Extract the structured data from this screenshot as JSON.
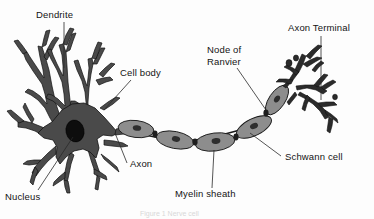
{
  "figure": {
    "background_color": "#fdfdfd",
    "caption": "Figure 1  Nerve cell"
  },
  "palette": {
    "cell_fill": "#4a4a4a",
    "cell_stroke": "#111111",
    "nucleus_fill": "#0d0d0d",
    "myelin_fill": "#8d8d8d",
    "myelin_stroke": "#1a1a1a",
    "schwann_nucleus": "#2e2e2e",
    "label_text": "#141414",
    "leader_line": "#2a2a2a"
  },
  "labels": [
    {
      "id": "dendrite",
      "text": "Dendrite",
      "lines": [
        "Dendrite"
      ]
    },
    {
      "id": "cell-body",
      "text": "Cell body",
      "lines": [
        "Cell body"
      ]
    },
    {
      "id": "node-of-ranvier",
      "text": "Node of Ranvier",
      "lines": [
        "Node of",
        "Ranvier"
      ]
    },
    {
      "id": "axon-terminal",
      "text": "Axon Terminal",
      "lines": [
        "Axon Terminal"
      ]
    },
    {
      "id": "axon",
      "text": "Axon",
      "lines": [
        "Axon"
      ]
    },
    {
      "id": "nucleus",
      "text": "Nucleus",
      "lines": [
        "Nucleus"
      ]
    },
    {
      "id": "myelin-sheath",
      "text": "Myelin sheath",
      "lines": [
        "Myelin sheath"
      ]
    },
    {
      "id": "schwann-cell",
      "text": "Schwann cell",
      "lines": [
        "Schwann cell"
      ]
    }
  ],
  "parts": [
    {
      "id": "dendrites",
      "name": "Dendrite"
    },
    {
      "id": "soma",
      "name": "Cell body"
    },
    {
      "id": "nucleus-shape",
      "name": "Nucleus"
    },
    {
      "id": "axon-shaft",
      "name": "Axon"
    },
    {
      "id": "myelin-chain",
      "name": "Myelin sheath",
      "segment_count": 5
    },
    {
      "id": "nodes",
      "name": "Node of Ranvier",
      "count": 4
    },
    {
      "id": "terminal-arbor",
      "name": "Axon Terminal"
    }
  ]
}
